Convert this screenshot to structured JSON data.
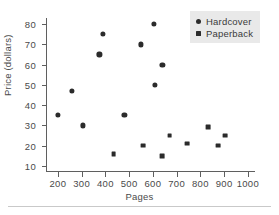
{
  "chart_data": {
    "type": "scatter",
    "title": "",
    "xlabel": "Pages",
    "ylabel": "Price (dollars)",
    "xlim": [
      150,
      1030
    ],
    "ylim": [
      7,
      83
    ],
    "xticks": [
      200,
      300,
      400,
      500,
      600,
      700,
      800,
      900,
      1000
    ],
    "yticks": [
      10,
      20,
      30,
      40,
      50,
      60,
      70,
      80
    ],
    "grid": false,
    "legend_position": "top-right",
    "series": [
      {
        "name": "Hardcover",
        "marker": "circle",
        "color": "#2b2b2b",
        "points": [
          {
            "x": 200,
            "y": 35
          },
          {
            "x": 260,
            "y": 47
          },
          {
            "x": 305,
            "y": 30
          },
          {
            "x": 375,
            "y": 65
          },
          {
            "x": 390,
            "y": 75
          },
          {
            "x": 480,
            "y": 35
          },
          {
            "x": 550,
            "y": 70
          },
          {
            "x": 605,
            "y": 80
          },
          {
            "x": 610,
            "y": 50
          },
          {
            "x": 640,
            "y": 60
          }
        ]
      },
      {
        "name": "Paperback",
        "marker": "square",
        "color": "#2b2b2b",
        "points": [
          {
            "x": 435,
            "y": 16
          },
          {
            "x": 560,
            "y": 20
          },
          {
            "x": 640,
            "y": 15
          },
          {
            "x": 670,
            "y": 25
          },
          {
            "x": 745,
            "y": 21
          },
          {
            "x": 833,
            "y": 29
          },
          {
            "x": 875,
            "y": 20
          },
          {
            "x": 903,
            "y": 25
          }
        ]
      }
    ]
  },
  "legend": {
    "items": [
      {
        "label": "Hardcover",
        "marker": "circle"
      },
      {
        "label": "Paperback",
        "marker": "square"
      }
    ]
  },
  "axes": {
    "x_title": "Pages",
    "y_title": "Price (dollars)"
  }
}
